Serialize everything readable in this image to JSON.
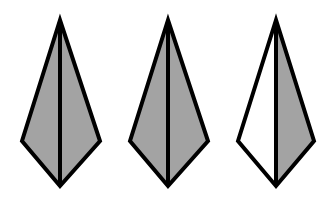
{
  "figure": {
    "description": "Three kite-shaped pyramids viewed from the side, each divided by a central vertical edge",
    "stroke_color": "#000000",
    "fill_shaded": "#a3a3a3",
    "fill_unshaded": "#ffffff",
    "shapes": [
      {
        "id": "kite-1",
        "left_face": "shaded",
        "right_face": "shaded",
        "top": [
          60,
          20
        ],
        "left": [
          22,
          141
        ],
        "right": [
          100,
          141
        ],
        "bottom": [
          60,
          186
        ]
      },
      {
        "id": "kite-2",
        "left_face": "shaded",
        "right_face": "shaded",
        "top": [
          168,
          20
        ],
        "left": [
          130,
          141
        ],
        "right": [
          208,
          141
        ],
        "bottom": [
          168,
          186
        ]
      },
      {
        "id": "kite-3",
        "left_face": "unshaded",
        "right_face": "shaded",
        "top": [
          276,
          20
        ],
        "left": [
          238,
          141
        ],
        "right": [
          314,
          141
        ],
        "bottom": [
          276,
          186
        ]
      }
    ]
  }
}
